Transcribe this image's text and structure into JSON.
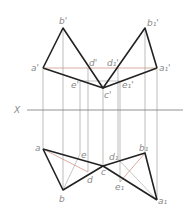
{
  "diagram": {
    "type": "descriptive-geometry-projection",
    "axis_label": "X",
    "colors": {
      "edge": "#222222",
      "projector": "#9a9a9a",
      "construction": "#c98a7a",
      "label": "#888888"
    },
    "front_view_labels": {
      "a_prime": "a'",
      "b_prime": "b'",
      "c_prime": "c'",
      "d_prime": "d'",
      "e_prime": "e'",
      "a1_prime": "a₁'",
      "b1_prime": "b₁'",
      "d1_prime": "d₁'",
      "e1_prime": "e₁'"
    },
    "top_view_labels": {
      "a": "a",
      "b": "b",
      "c": "c",
      "d": "d",
      "e": "e",
      "a1": "a₁",
      "b1": "b₁",
      "d1": "d₁",
      "e1": "e₁"
    }
  }
}
